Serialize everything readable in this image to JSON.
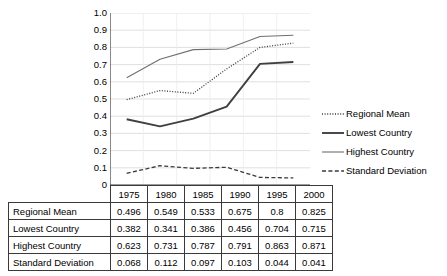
{
  "chart_data": {
    "type": "line",
    "title": "",
    "xlabel": "",
    "ylabel": "",
    "categories": [
      "1975",
      "1980",
      "1985",
      "1990",
      "1995",
      "2000"
    ],
    "ylim": [
      0,
      1.0
    ],
    "ytick_labels": [
      "1.0",
      "0.9",
      "0.8",
      "0.7",
      "0.6",
      "0.5",
      "0.4",
      "0.3",
      "0.2",
      "0.1",
      "0"
    ],
    "ytick_values": [
      1.0,
      0.9,
      0.8,
      0.7,
      0.6,
      0.5,
      0.4,
      0.3,
      0.2,
      0.1,
      0
    ],
    "grid": true,
    "legend_position": "right",
    "series": [
      {
        "name": "Regional Mean",
        "style": "dotted",
        "color": "#3a3a3a",
        "values": [
          0.496,
          0.549,
          0.533,
          0.675,
          0.8,
          0.825
        ],
        "value_labels": [
          "0.496",
          "0.549",
          "0.533",
          "0.675",
          "0.8",
          "0.825"
        ]
      },
      {
        "name": "Lowest Country",
        "style": "solid-thick",
        "color": "#404040",
        "values": [
          0.382,
          0.341,
          0.386,
          0.456,
          0.704,
          0.715
        ],
        "value_labels": [
          "0.382",
          "0.341",
          "0.386",
          "0.456",
          "0.704",
          "0.715"
        ]
      },
      {
        "name": "Highest Country",
        "style": "solid-thin",
        "color": "#707070",
        "values": [
          0.623,
          0.731,
          0.787,
          0.791,
          0.863,
          0.871
        ],
        "value_labels": [
          "0.623",
          "0.731",
          "0.787",
          "0.791",
          "0.863",
          "0.871"
        ]
      },
      {
        "name": "Standard Deviation",
        "style": "dashed",
        "color": "#3a3a3a",
        "values": [
          0.068,
          0.112,
          0.097,
          0.103,
          0.044,
          0.041
        ],
        "value_labels": [
          "0.068",
          "0.112",
          "0.097",
          "0.103",
          "0.044",
          "0.041"
        ]
      }
    ]
  },
  "table": {
    "corner_label": "",
    "header": [
      "1975",
      "1980",
      "1985",
      "1990",
      "1995",
      "2000"
    ],
    "rows": [
      {
        "label": "Regional Mean",
        "cells": [
          "0.496",
          "0.549",
          "0.533",
          "0.675",
          "0.8",
          "0.825"
        ]
      },
      {
        "label": "Lowest Country",
        "cells": [
          "0.382",
          "0.341",
          "0.386",
          "0.456",
          "0.704",
          "0.715"
        ]
      },
      {
        "label": "Highest Country",
        "cells": [
          "0.623",
          "0.731",
          "0.787",
          "0.791",
          "0.863",
          "0.871"
        ]
      },
      {
        "label": "Standard Deviation",
        "cells": [
          "0.068",
          "0.112",
          "0.097",
          "0.103",
          "0.044",
          "0.041"
        ]
      }
    ]
  },
  "legend": {
    "items": [
      {
        "label": "Regional Mean"
      },
      {
        "label": "Lowest Country"
      },
      {
        "label": "Highest Country"
      },
      {
        "label": "Standard Deviation"
      }
    ]
  }
}
